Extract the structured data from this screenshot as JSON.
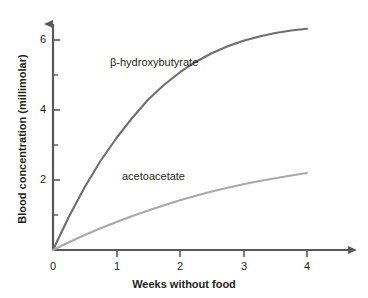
{
  "chart_data": {
    "type": "line",
    "title": "",
    "xlabel": "Weeks without food",
    "ylabel": "Blood concentration (millimolar)",
    "xlim": [
      0,
      4.6
    ],
    "ylim": [
      0,
      6.8
    ],
    "x_ticks": [
      "0",
      "1",
      "2",
      "3",
      "4"
    ],
    "x_tick_values": [
      0,
      1,
      2,
      3,
      4
    ],
    "y_ticks": [
      "2",
      "4",
      "6"
    ],
    "y_tick_values": [
      2,
      4,
      6
    ],
    "y_minor_tick_values": [
      1,
      3,
      5
    ],
    "grid": false,
    "legend_position": "inline-annotations",
    "series": [
      {
        "name": "β-hydroxybutyrate",
        "color": "#6e6e6e",
        "x": [
          0,
          0.25,
          0.5,
          0.75,
          1,
          1.25,
          1.5,
          1.75,
          2,
          2.25,
          2.5,
          2.75,
          3,
          3.25,
          3.5,
          3.75,
          4
        ],
        "values": [
          0,
          0.95,
          1.8,
          2.55,
          3.2,
          3.78,
          4.3,
          4.72,
          5.08,
          5.38,
          5.62,
          5.82,
          5.98,
          6.1,
          6.2,
          6.27,
          6.32
        ],
        "label_text": "β-hydroxybutyrate"
      },
      {
        "name": "acetoacetate",
        "color": "#a9a9a9",
        "x": [
          0,
          0.25,
          0.5,
          0.75,
          1,
          1.25,
          1.5,
          1.75,
          2,
          2.25,
          2.5,
          2.75,
          3,
          3.25,
          3.5,
          3.75,
          4
        ],
        "values": [
          0,
          0.22,
          0.43,
          0.62,
          0.8,
          0.97,
          1.13,
          1.28,
          1.42,
          1.55,
          1.67,
          1.78,
          1.88,
          1.97,
          2.05,
          2.13,
          2.2
        ],
        "label_text": "acetoacetate"
      }
    ],
    "annotations": [
      {
        "text": "β-hydroxybutyrate",
        "x_px": 110,
        "y_px": 56
      },
      {
        "text": "acetoacetate",
        "x_px": 122,
        "y_px": 170
      }
    ]
  },
  "axes": {
    "x_title": "Weeks without food",
    "y_title": "Blood concentration (millimolar)",
    "axis_color": "#58595b",
    "tick_labels_x": [
      "0",
      "1",
      "2",
      "3",
      "4"
    ],
    "tick_labels_y": [
      "6",
      "4",
      "2"
    ]
  }
}
